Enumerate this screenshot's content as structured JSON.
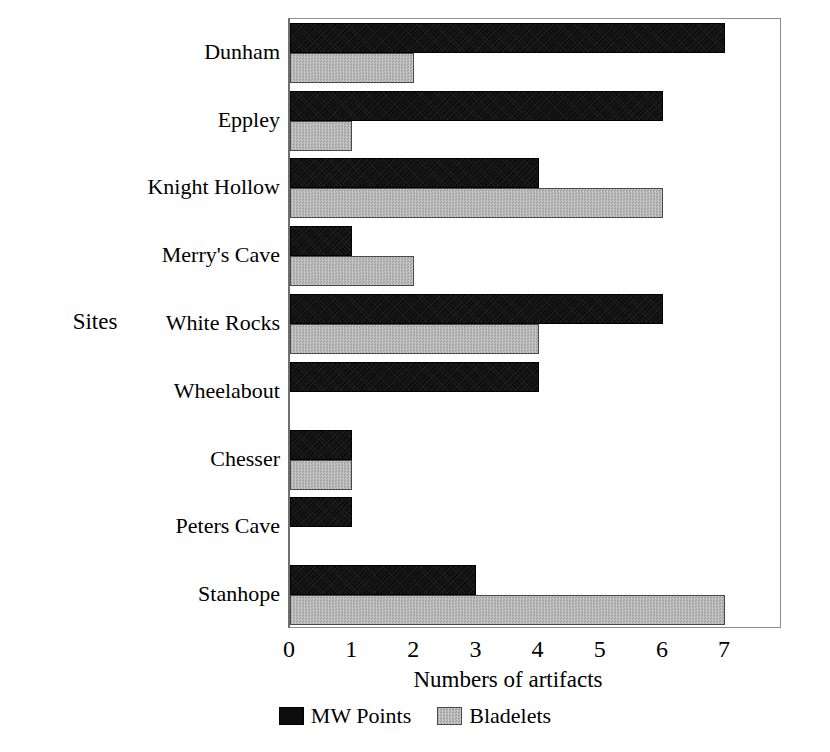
{
  "chart_data": {
    "type": "bar",
    "orientation": "horizontal",
    "title": "",
    "xlabel": "Numbers of artifacts",
    "ylabel": "Sites",
    "categories": [
      "Dunham",
      "Eppley",
      "Knight Hollow",
      "Merry's Cave",
      "White Rocks",
      "Wheelabout",
      "Chesser",
      "Peters Cave",
      "Stanhope"
    ],
    "series": [
      {
        "name": "MW Points",
        "color": "#0d0d0d",
        "values": [
          7,
          6,
          4,
          1,
          6,
          4,
          1,
          1,
          3
        ]
      },
      {
        "name": "Bladelets",
        "color": "#b3b3b3",
        "values": [
          2,
          1,
          6,
          2,
          4,
          0,
          1,
          0,
          7
        ]
      }
    ],
    "xticks": [
      0,
      1,
      2,
      3,
      4,
      5,
      6,
      7
    ],
    "xtick_labels": [
      "0",
      "1",
      "2",
      "3",
      "4",
      "5",
      "6",
      "7"
    ],
    "xlim": [
      0,
      7.9
    ],
    "grid": false,
    "legend_position": "bottom-center"
  }
}
